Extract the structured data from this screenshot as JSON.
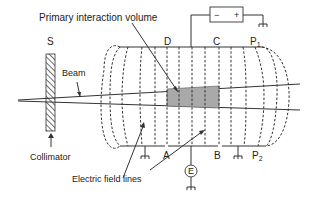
{
  "diagram": {
    "labels": {
      "primary_volume": "Primary interaction volume",
      "source": "S",
      "beam": "Beam",
      "collimator": "Collimator",
      "field_lines": "Electric field lines",
      "plate_d": "D",
      "plate_c": "C",
      "plate_a": "A",
      "plate_b": "B",
      "plate_p1": "P",
      "plate_p1_sub": "1",
      "plate_p2": "P",
      "plate_p2_sub": "2",
      "electrometer": "E",
      "battery_minus": "−",
      "battery_plus": "+"
    },
    "colors": {
      "ink": "#333333",
      "interaction_fill": "#a9a9a9",
      "background": "#ffffff"
    }
  }
}
